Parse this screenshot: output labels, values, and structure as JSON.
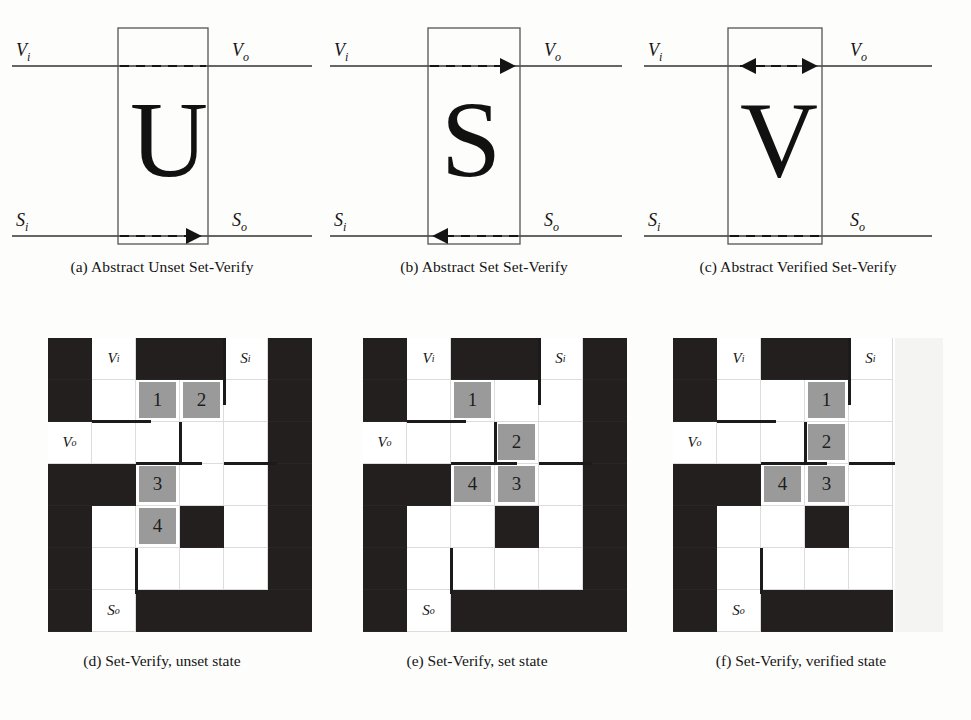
{
  "figure": {
    "colors": {
      "black_cell": "#231f1f",
      "gray_cell": "#9a9a9a",
      "white_cell": "#ffffff",
      "wire": "#1b1b1b",
      "background": "#fdfdfc"
    }
  },
  "abstract_panels": [
    {
      "id": "a",
      "caption": "(a) Abstract Unset Set-Verify",
      "letter": "U",
      "labels": {
        "top_left": "V",
        "top_left_sub": "i",
        "top_right": "V",
        "top_right_sub": "o",
        "bottom_left": "S",
        "bottom_left_sub": "i",
        "bottom_right": "S",
        "bottom_right_sub": "o"
      },
      "top_dashed_arrow": "none",
      "bottom_dashed_arrow": "right"
    },
    {
      "id": "b",
      "caption": "(b) Abstract Set Set-Verify",
      "letter": "S",
      "labels": {
        "top_left": "V",
        "top_left_sub": "i",
        "top_right": "V",
        "top_right_sub": "o",
        "bottom_left": "S",
        "bottom_left_sub": "i",
        "bottom_right": "S",
        "bottom_right_sub": "o"
      },
      "top_dashed_arrow": "right",
      "bottom_dashed_arrow": "left"
    },
    {
      "id": "c",
      "caption": "(c) Abstract Verified Set-Verify",
      "letter": "V",
      "labels": {
        "top_left": "V",
        "top_left_sub": "i",
        "top_right": "V",
        "top_right_sub": "o",
        "bottom_left": "S",
        "bottom_left_sub": "i",
        "bottom_right": "S",
        "bottom_right_sub": "o"
      },
      "top_dashed_arrow": "both",
      "bottom_dashed_arrow": "none"
    }
  ],
  "grid_panels": [
    {
      "id": "d",
      "caption": "(d) Set-Verify, unset state",
      "rows": 7,
      "cols": 6,
      "clipped": false,
      "cells": [
        [
          "black",
          "label:Vi",
          "black",
          "black",
          "label:Si",
          "black"
        ],
        [
          "black",
          "white",
          "gray:1",
          "gray:2",
          "white",
          "black"
        ],
        [
          "label:Vo",
          "white",
          "white",
          "white",
          "white",
          "black"
        ],
        [
          "black",
          "black",
          "gray:3",
          "white",
          "white",
          "black"
        ],
        [
          "black",
          "white",
          "gray:4",
          "black",
          "white",
          "black"
        ],
        [
          "black",
          "white",
          "white",
          "white",
          "white",
          "black"
        ],
        [
          "black",
          "label:So",
          "black",
          "black",
          "black",
          "black"
        ]
      ],
      "wires": [
        {
          "type": "h",
          "col": 1,
          "row": 1,
          "edge": "bottom",
          "span": 1.35
        },
        {
          "type": "v",
          "col": 3,
          "row": 2,
          "edge": "left",
          "span": 1.0
        },
        {
          "type": "h",
          "col": 2,
          "row": 2,
          "edge": "bottom",
          "span": 1.5
        },
        {
          "type": "h",
          "col": 4,
          "row": 2,
          "edge": "bottom",
          "span": 1.2
        },
        {
          "type": "v",
          "col": 4,
          "row": 0,
          "edge": "left",
          "span": 1.6
        },
        {
          "type": "v",
          "col": 2,
          "row": 5,
          "edge": "left",
          "span": 1.1
        }
      ]
    },
    {
      "id": "e",
      "caption": "(e) Set-Verify, set state",
      "rows": 7,
      "cols": 6,
      "clipped": false,
      "cells": [
        [
          "black",
          "label:Vi",
          "black",
          "black",
          "label:Si",
          "black"
        ],
        [
          "black",
          "white",
          "gray:1",
          "white",
          "white",
          "black"
        ],
        [
          "label:Vo",
          "white",
          "white",
          "gray:2",
          "white",
          "black"
        ],
        [
          "black",
          "black",
          "gray:4",
          "gray:3",
          "white",
          "black"
        ],
        [
          "black",
          "white",
          "white",
          "black",
          "white",
          "black"
        ],
        [
          "black",
          "white",
          "white",
          "white",
          "white",
          "black"
        ],
        [
          "black",
          "label:So",
          "black",
          "black",
          "black",
          "black"
        ]
      ],
      "wires": [
        {
          "type": "h",
          "col": 1,
          "row": 1,
          "edge": "bottom",
          "span": 1.35
        },
        {
          "type": "v",
          "col": 3,
          "row": 2,
          "edge": "left",
          "span": 1.0
        },
        {
          "type": "h",
          "col": 2,
          "row": 2,
          "edge": "bottom",
          "span": 1.5
        },
        {
          "type": "h",
          "col": 4,
          "row": 2,
          "edge": "bottom",
          "span": 1.2
        },
        {
          "type": "v",
          "col": 4,
          "row": 0,
          "edge": "left",
          "span": 1.6
        },
        {
          "type": "v",
          "col": 2,
          "row": 5,
          "edge": "left",
          "span": 1.1
        }
      ]
    },
    {
      "id": "f",
      "caption": "(f) Set-Verify, verified state",
      "rows": 7,
      "cols": 6,
      "clipped": true,
      "cells": [
        [
          "black",
          "label:Vi",
          "black",
          "black",
          "label:Si",
          "clip"
        ],
        [
          "black",
          "white",
          "white",
          "gray:1",
          "white",
          "clip"
        ],
        [
          "label:Vo",
          "white",
          "white",
          "gray:2",
          "white",
          "clip"
        ],
        [
          "black",
          "black",
          "gray:4",
          "gray:3",
          "white",
          "clip"
        ],
        [
          "black",
          "white",
          "white",
          "black",
          "white",
          "clip"
        ],
        [
          "black",
          "white",
          "white",
          "white",
          "white",
          "clip"
        ],
        [
          "black",
          "label:So",
          "black",
          "black",
          "black",
          "clip"
        ]
      ],
      "wires": [
        {
          "type": "h",
          "col": 1,
          "row": 1,
          "edge": "bottom",
          "span": 1.35
        },
        {
          "type": "v",
          "col": 3,
          "row": 2,
          "edge": "left",
          "span": 1.0
        },
        {
          "type": "h",
          "col": 2,
          "row": 2,
          "edge": "bottom",
          "span": 1.5
        },
        {
          "type": "h",
          "col": 4,
          "row": 2,
          "edge": "bottom",
          "span": 1.2
        },
        {
          "type": "v",
          "col": 4,
          "row": 0,
          "edge": "left",
          "span": 1.6
        },
        {
          "type": "v",
          "col": 2,
          "row": 5,
          "edge": "left",
          "span": 1.1
        }
      ]
    }
  ],
  "cell_legend": {
    "numbered_chips": [
      "1",
      "2",
      "3",
      "4"
    ],
    "port_labels": [
      "Vi",
      "Vo",
      "Si",
      "So"
    ]
  }
}
